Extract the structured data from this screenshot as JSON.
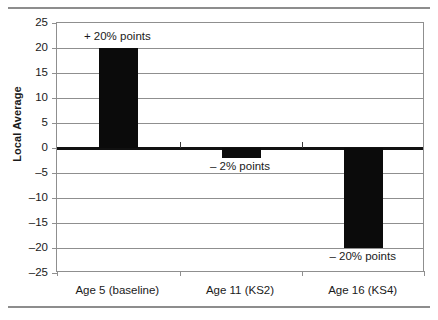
{
  "chart_data": {
    "type": "bar",
    "title": "",
    "xlabel": "",
    "ylabel": "Local Average",
    "ylim": [
      -25,
      25
    ],
    "ytick_step": 5,
    "grid": true,
    "legend": "none",
    "categories": [
      "Age 5 (baseline)",
      "Age 11 (KS2)",
      "Age 16 (KS4)"
    ],
    "values": [
      20,
      -2,
      -20
    ],
    "bar_color": "#0b0b0b",
    "annotations": [
      "+ 20% points",
      "– 2% points",
      "– 20% points"
    ],
    "ytick_labels": [
      "25",
      "20",
      "15",
      "10",
      "5",
      "0",
      "–5",
      "–10",
      "–15",
      "–20",
      "–25"
    ],
    "ytick_values": [
      25,
      20,
      15,
      10,
      5,
      0,
      -5,
      -10,
      -15,
      -20,
      -25
    ],
    "axis_color": "#8f8f8f",
    "zeroline_color": "#111111"
  }
}
